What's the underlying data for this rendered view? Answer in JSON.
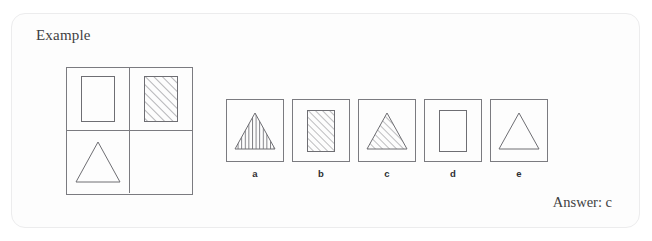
{
  "card": {
    "title": "Example",
    "border_color": "#ececed",
    "background_color": "#fdfdfd"
  },
  "matrix": {
    "name": "2x2 analogy matrix",
    "stroke_color": "#7b7b80",
    "rows": 2,
    "cols": 2,
    "cells": [
      {
        "position": "top-left",
        "shape": "rectangle",
        "fill": "none",
        "blank": false
      },
      {
        "position": "top-right",
        "shape": "rectangle",
        "fill": "diagonal-hatch",
        "blank": false
      },
      {
        "position": "bottom-left",
        "shape": "triangle",
        "fill": "none",
        "blank": false
      },
      {
        "position": "bottom-right",
        "shape": "none",
        "fill": "none",
        "blank": true
      }
    ]
  },
  "options": [
    {
      "label": "a",
      "shape": "triangle",
      "fill": "vertical-hatch"
    },
    {
      "label": "b",
      "shape": "rectangle",
      "fill": "diagonal-hatch"
    },
    {
      "label": "c",
      "shape": "triangle",
      "fill": "diagonal-hatch"
    },
    {
      "label": "d",
      "shape": "rectangle",
      "fill": "none"
    },
    {
      "label": "e",
      "shape": "triangle",
      "fill": "none"
    }
  ],
  "answer": {
    "text": "Answer: c",
    "value": "c"
  }
}
